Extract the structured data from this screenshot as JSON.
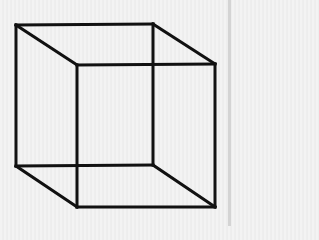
{
  "figure": {
    "stroke_color": "#111111",
    "background_color": "#efefef",
    "stroke_width": 3,
    "vertices": {
      "back_top_left": [
        16,
        25
      ],
      "back_top_right": [
        153,
        24
      ],
      "back_bottom_left": [
        16,
        166
      ],
      "back_bottom_right": [
        153,
        165
      ],
      "front_top_left": [
        77,
        65
      ],
      "front_top_right": [
        215,
        64
      ],
      "front_bottom_left": [
        77,
        207
      ],
      "front_bottom_right": [
        215,
        207
      ]
    }
  }
}
